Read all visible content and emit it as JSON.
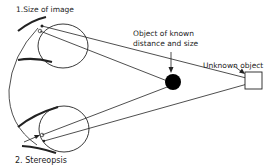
{
  "diagram": {
    "labels": {
      "size_of_image": "1.Size of image",
      "known_object_line1": "Object of known",
      "known_object_line2": "distance and size",
      "unknown_object": "Unknown object",
      "stereopsis": "2. Stereopsis"
    },
    "colors": {
      "stroke": "#222222",
      "background": "#ffffff",
      "known_object_fill": "#000000"
    }
  }
}
